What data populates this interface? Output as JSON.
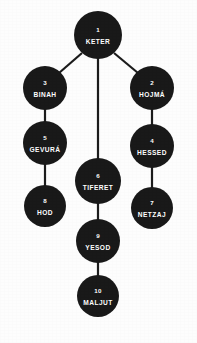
{
  "diagram": {
    "type": "tree-of-life-sefirot",
    "background_color": "#fdfdfd",
    "node_color": "#191919",
    "label_color": "#ffffff",
    "edge_color": "#1c1c1c",
    "nodes": [
      {
        "id": "keter",
        "number": "1",
        "label": "KETER",
        "cx": 98,
        "cy": 35,
        "r": 24
      },
      {
        "id": "hojma",
        "number": "2",
        "label": "HOJMÁ",
        "cx": 152,
        "cy": 88,
        "r": 22
      },
      {
        "id": "binah",
        "number": "3",
        "label": "BINAH",
        "cx": 45,
        "cy": 88,
        "r": 22
      },
      {
        "id": "hessed",
        "number": "4",
        "label": "HESSED",
        "cx": 152,
        "cy": 146,
        "r": 22
      },
      {
        "id": "gevura",
        "number": "5",
        "label": "GEVURÁ",
        "cx": 45,
        "cy": 143,
        "r": 22
      },
      {
        "id": "tiferet",
        "number": "6",
        "label": "TIFERET",
        "cx": 98,
        "cy": 181,
        "r": 23
      },
      {
        "id": "netzaj",
        "number": "7",
        "label": "NETZAJ",
        "cx": 152,
        "cy": 208,
        "r": 21
      },
      {
        "id": "hod",
        "number": "8",
        "label": "HOD",
        "cx": 45,
        "cy": 206,
        "r": 21
      },
      {
        "id": "yesod",
        "number": "9",
        "label": "YESOD",
        "cx": 98,
        "cy": 241,
        "r": 22
      },
      {
        "id": "maljut",
        "number": "10",
        "label": "MALJUT",
        "cx": 98,
        "cy": 296,
        "r": 21
      }
    ],
    "edges": [
      {
        "id": "keter-binah",
        "from": "keter",
        "to": "binah",
        "x1": 82,
        "y1": 53,
        "x2": 59,
        "y2": 73
      },
      {
        "id": "keter-hojma",
        "from": "keter",
        "to": "hojma",
        "x1": 114,
        "y1": 53,
        "x2": 138,
        "y2": 73
      },
      {
        "id": "keter-tiferet",
        "from": "keter",
        "to": "tiferet",
        "x1": 98,
        "y1": 58,
        "x2": 98,
        "y2": 159
      },
      {
        "id": "binah-gevura",
        "from": "binah",
        "to": "gevura",
        "x1": 45,
        "y1": 109,
        "x2": 45,
        "y2": 122
      },
      {
        "id": "gevura-hod",
        "from": "gevura",
        "to": "hod",
        "x1": 45,
        "y1": 164,
        "x2": 45,
        "y2": 186
      },
      {
        "id": "hojma-hessed",
        "from": "hojma",
        "to": "hessed",
        "x1": 152,
        "y1": 109,
        "x2": 152,
        "y2": 125
      },
      {
        "id": "hessed-netzaj",
        "from": "hessed",
        "to": "netzaj",
        "x1": 152,
        "y1": 167,
        "x2": 152,
        "y2": 188
      },
      {
        "id": "tiferet-yesod",
        "from": "tiferet",
        "to": "yesod",
        "x1": 98,
        "y1": 203,
        "x2": 98,
        "y2": 220
      },
      {
        "id": "yesod-maljut",
        "from": "yesod",
        "to": "maljut",
        "x1": 98,
        "y1": 262,
        "x2": 98,
        "y2": 276
      }
    ]
  }
}
